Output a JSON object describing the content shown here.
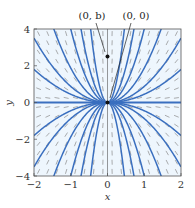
{
  "chart_data": {
    "type": "line",
    "subtype": "direction-field-with-solution-curves",
    "title": "",
    "xlabel": "x",
    "ylabel": "y",
    "xlim": [
      -2,
      2
    ],
    "ylim": [
      -4,
      4
    ],
    "x_ticks": [
      -2,
      -1,
      0,
      1,
      2
    ],
    "x_tick_labels": [
      "−2",
      "−1",
      "0",
      "1",
      "2"
    ],
    "y_ticks": [
      -4,
      -2,
      0,
      2,
      4
    ],
    "y_tick_labels": [
      "−4",
      "−2",
      "0",
      "2",
      "4"
    ],
    "grid": false,
    "field": {
      "slope": "2y/x",
      "columns": 16,
      "rows": 16,
      "color": "#8a8a8a"
    },
    "solution_family": "y = C x^2",
    "series": [
      {
        "name": "C=0",
        "C": 0
      },
      {
        "name": "C=0.45",
        "C": 0.45
      },
      {
        "name": "C=0.875",
        "C": 0.875
      },
      {
        "name": "C=1.875",
        "C": 1.875
      },
      {
        "name": "C=4",
        "C": 4
      },
      {
        "name": "C=7.7",
        "C": 7.7
      },
      {
        "name": "C=19",
        "C": 19
      },
      {
        "name": "C=-0.45",
        "C": -0.45
      },
      {
        "name": "C=-0.875",
        "C": -0.875
      },
      {
        "name": "C=-1.875",
        "C": -1.875
      },
      {
        "name": "C=-4",
        "C": -4
      },
      {
        "name": "C=-7.7",
        "C": -7.7
      },
      {
        "name": "C=-19",
        "C": -19
      }
    ],
    "curve_color": "#3a6fbf",
    "points": [
      {
        "label": "(0, b)",
        "x": 0,
        "y": 2.5
      },
      {
        "label": "(0, 0)",
        "x": 0,
        "y": 0
      }
    ],
    "annotations": [
      {
        "text": "(0, b)",
        "target": "(0, b)"
      },
      {
        "text": "(0, 0)",
        "target": "(0, 0)"
      }
    ]
  }
}
